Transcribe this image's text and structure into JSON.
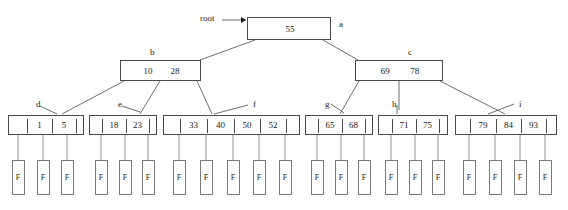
{
  "diagram": {
    "root_pointer_label": "root",
    "record_label": "F",
    "line_color": "#4a4a4a",
    "text_color": "#1a1a1a",
    "background": "#ffffff"
  },
  "nodes": [
    {
      "id": "a",
      "label": "a",
      "level": "root",
      "keys": [
        "55"
      ],
      "x": 247,
      "y": 17,
      "w": 84,
      "h": 23,
      "label_x": 339,
      "label_y": 20,
      "ticks": [],
      "children": [
        "b",
        "c"
      ]
    },
    {
      "id": "b",
      "label": "b",
      "level": "internal",
      "keys": [
        "10",
        "28"
      ],
      "x": 120,
      "y": 60,
      "w": 81,
      "h": 21,
      "label_x": 150,
      "label_y": 48,
      "ticks": [],
      "children": [
        "d",
        "e",
        "f"
      ]
    },
    {
      "id": "c",
      "label": "c",
      "level": "internal",
      "keys": [
        "69",
        "78"
      ],
      "x": 355,
      "y": 60,
      "w": 88,
      "h": 21,
      "label_x": 408,
      "label_y": 48,
      "ticks": [],
      "children": [
        "g",
        "h",
        "i"
      ]
    },
    {
      "id": "d",
      "label": "d",
      "level": "leaf",
      "keys": [
        "1",
        "5"
      ],
      "x": 8,
      "y": 115,
      "w": 76,
      "h": 20,
      "label_x": 36,
      "label_y": 100,
      "ticks": [
        18,
        43,
        67
      ],
      "children": []
    },
    {
      "id": "e",
      "label": "e",
      "level": "leaf",
      "keys": [
        "18",
        "23"
      ],
      "x": 89,
      "y": 115,
      "w": 68,
      "h": 20,
      "label_x": 118,
      "label_y": 100,
      "ticks": [
        12,
        36,
        59
      ],
      "children": []
    },
    {
      "id": "f",
      "label": "f",
      "level": "leaf",
      "keys": [
        "33",
        "40",
        "50",
        "52"
      ],
      "x": 163,
      "y": 115,
      "w": 137,
      "h": 20,
      "label_x": 253,
      "label_y": 100,
      "ticks": [
        16,
        43,
        70,
        96,
        122
      ],
      "children": []
    },
    {
      "id": "g",
      "label": "g",
      "level": "leaf",
      "keys": [
        "65",
        "68"
      ],
      "x": 305,
      "y": 115,
      "w": 68,
      "h": 20,
      "label_x": 325,
      "label_y": 100,
      "ticks": [
        12,
        36,
        59
      ],
      "children": []
    },
    {
      "id": "h",
      "label": "h",
      "level": "leaf",
      "keys": [
        "71",
        "75"
      ],
      "x": 378,
      "y": 115,
      "w": 70,
      "h": 20,
      "label_x": 392,
      "label_y": 100,
      "ticks": [
        13,
        37,
        60
      ],
      "children": []
    },
    {
      "id": "i",
      "label": "i",
      "level": "leaf",
      "keys": [
        "79",
        "84",
        "93"
      ],
      "x": 455,
      "y": 115,
      "w": 102,
      "h": 20,
      "label_x": 519,
      "label_y": 100,
      "ticks": [
        14,
        40,
        65,
        90
      ],
      "children": []
    }
  ],
  "records": [
    {
      "parent": "d",
      "x": 18
    },
    {
      "parent": "d",
      "x": 43
    },
    {
      "parent": "d",
      "x": 67
    },
    {
      "parent": "e",
      "x": 101
    },
    {
      "parent": "e",
      "x": 125
    },
    {
      "parent": "e",
      "x": 148
    },
    {
      "parent": "f",
      "x": 179
    },
    {
      "parent": "f",
      "x": 206
    },
    {
      "parent": "f",
      "x": 233
    },
    {
      "parent": "f",
      "x": 259
    },
    {
      "parent": "f",
      "x": 285
    },
    {
      "parent": "g",
      "x": 317
    },
    {
      "parent": "g",
      "x": 341
    },
    {
      "parent": "g",
      "x": 364
    },
    {
      "parent": "h",
      "x": 391
    },
    {
      "parent": "h",
      "x": 415
    },
    {
      "parent": "h",
      "x": 438
    },
    {
      "parent": "i",
      "x": 469
    },
    {
      "parent": "i",
      "x": 495
    },
    {
      "parent": "i",
      "x": 520
    },
    {
      "parent": "i",
      "x": 545
    }
  ],
  "record_box": {
    "w": 13,
    "h": 35,
    "top": 160
  },
  "root_arrow": {
    "label_x": 200,
    "label_y": 14,
    "line_from_x": 222,
    "line_from_y": 20,
    "line_to_x": 246,
    "line_to_y": 20
  },
  "edges": [
    {
      "from": "a",
      "to": "b",
      "x1": 255,
      "y1": 40,
      "x2": 200,
      "y2": 60
    },
    {
      "from": "a",
      "to": "c",
      "x1": 323,
      "y1": 40,
      "x2": 358,
      "y2": 60
    },
    {
      "from": "b",
      "to": "d",
      "x1": 124,
      "y1": 81,
      "x2": 62,
      "y2": 114
    },
    {
      "from": "b",
      "to": "e",
      "x1": 160,
      "y1": 81,
      "x2": 140,
      "y2": 114
    },
    {
      "from": "b",
      "to": "f",
      "x1": 197,
      "y1": 81,
      "x2": 212,
      "y2": 114
    },
    {
      "from": "c",
      "to": "g",
      "x1": 359,
      "y1": 81,
      "x2": 340,
      "y2": 114
    },
    {
      "from": "c",
      "to": "h",
      "x1": 399,
      "y1": 81,
      "x2": 399,
      "y2": 110
    },
    {
      "from": "c",
      "to": "i",
      "x1": 440,
      "y1": 81,
      "x2": 505,
      "y2": 114
    }
  ],
  "label_leaders": [
    {
      "node": "d",
      "x1": 40,
      "y1": 106,
      "x2": 57,
      "y2": 114
    },
    {
      "node": "e",
      "x1": 122,
      "y1": 106,
      "x2": 140,
      "y2": 112
    },
    {
      "node": "f",
      "x1": 248,
      "y1": 105,
      "x2": 214,
      "y2": 114
    },
    {
      "node": "g",
      "x1": 331,
      "y1": 104,
      "x2": 344,
      "y2": 113
    },
    {
      "node": "h",
      "x1": 397,
      "y1": 105,
      "x2": 397,
      "y2": 114
    },
    {
      "node": "i",
      "x1": 514,
      "y1": 104,
      "x2": 488,
      "y2": 114
    }
  ]
}
